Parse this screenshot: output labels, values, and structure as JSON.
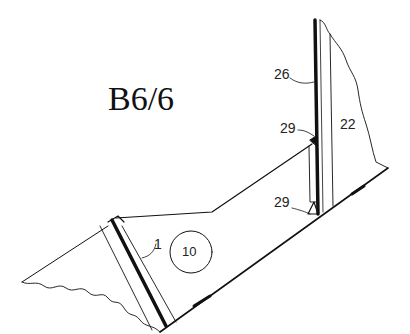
{
  "figure": {
    "title": "B6/6",
    "labels": {
      "part_26": "26",
      "part_29_upper": "29",
      "part_22": "22",
      "part_29_lower": "29",
      "part_1": "1",
      "part_10": "10"
    },
    "colors": {
      "ink": "#111111",
      "background": "#ffffff"
    }
  }
}
